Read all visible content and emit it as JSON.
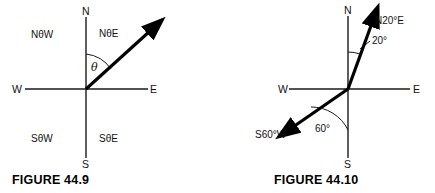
{
  "figures": [
    {
      "id": "figure-44-9",
      "caption": "FIGURE 44.9",
      "axis_labels": {
        "north": "N",
        "south": "S",
        "east": "E",
        "west": "W"
      },
      "quadrant_labels": {
        "northwest": "NθW",
        "northeast": "NθE",
        "southwest": "SθW",
        "southeast": "SθE"
      },
      "angle_label": "θ",
      "vector": {
        "name": "bearing-vector",
        "from_axis": "N",
        "toward": "E",
        "angle_from_north_deg": 47
      }
    },
    {
      "id": "figure-44-10",
      "caption": "FIGURE 44.10",
      "axis_labels": {
        "north": "N",
        "south": "S",
        "east": "E",
        "west": "W"
      },
      "vectors": [
        {
          "name": "n20e-vector",
          "label": "N20°E",
          "angle_label": "20°",
          "angle_from_north_deg": 20
        },
        {
          "name": "s60w-vector",
          "label": "S60°W",
          "angle_label": "60°",
          "angle_from_south_deg": 60
        }
      ]
    }
  ],
  "colors": {
    "ink": "#111111",
    "axis": "#1a1a1a",
    "vector": "#000000",
    "background": "#ffffff"
  }
}
